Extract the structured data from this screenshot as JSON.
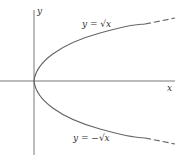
{
  "diagram": {
    "axes": {
      "x_label": "x",
      "y_label": "y"
    },
    "curves": [
      {
        "name": "upper",
        "equation": "y = √x",
        "label": "y = √x"
      },
      {
        "name": "lower",
        "equation": "y = −√x",
        "label": "y = −√x"
      }
    ],
    "colors": {
      "axis": "#555555",
      "curve": "#666666"
    }
  }
}
